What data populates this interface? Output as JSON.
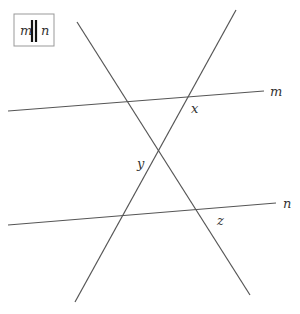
{
  "legend": {
    "left_label": "m",
    "right_label": "n",
    "symbol": "parallel"
  },
  "lines": {
    "m": {
      "label": "m",
      "x1": 8,
      "y1": 111,
      "x2": 264,
      "y2": 91
    },
    "n": {
      "label": "n",
      "x1": 8,
      "y1": 225,
      "x2": 276,
      "y2": 203
    },
    "transversal_1": {
      "x1": 77,
      "y1": 22,
      "x2": 250,
      "y2": 295
    },
    "transversal_2": {
      "x1": 236,
      "y1": 10,
      "x2": 75,
      "y2": 302
    }
  },
  "angle_labels": {
    "x": "x",
    "y": "y",
    "z": "z"
  },
  "colors": {
    "line": "#555555",
    "text": "#333333",
    "legend_border": "#999999"
  }
}
